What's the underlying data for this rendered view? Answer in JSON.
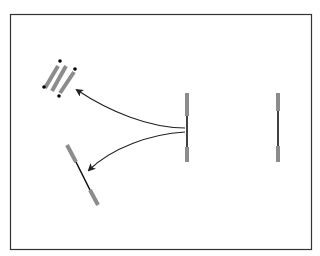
{
  "diagram": {
    "title_visible": false,
    "frame": {
      "x": 10,
      "y": 14,
      "width": 302,
      "height": 236,
      "stroke": "#333333"
    },
    "colors": {
      "rod_gray": "#8c8c8c",
      "rod_black": "#111111",
      "arrow": "#222222",
      "dot": "#000000",
      "background": "#ffffff"
    },
    "elements": [
      {
        "id": "stacked-rods",
        "type": "cluster",
        "count": 3,
        "orientation": "diagonal"
      },
      {
        "id": "rod-center",
        "type": "vertical-rod"
      },
      {
        "id": "rod-right",
        "type": "vertical-rod"
      },
      {
        "id": "rod-tilted",
        "type": "tilted-rod"
      }
    ],
    "arrows": [
      {
        "from": "rod-center",
        "to": "stacked-rods"
      },
      {
        "from": "rod-center",
        "to": "rod-tilted"
      }
    ]
  }
}
